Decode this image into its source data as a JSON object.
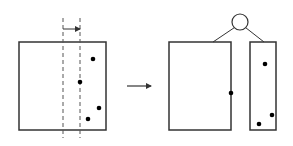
{
  "diagram": {
    "colors": {
      "stroke": "#333333",
      "dot": "#000000",
      "background": "#ffffff"
    },
    "before": {
      "box": {
        "x": 19,
        "y": 42,
        "w": 87,
        "h": 88
      },
      "dashed_lines": [
        {
          "x": 63,
          "y1": 18,
          "y2": 138
        },
        {
          "x": 80,
          "y1": 18,
          "y2": 138
        }
      ],
      "shift_arrow": {
        "x1": 63,
        "x2": 80,
        "y": 29
      },
      "points": [
        {
          "x": 93,
          "y": 59
        },
        {
          "x": 80,
          "y": 82
        },
        {
          "x": 99,
          "y": 108
        },
        {
          "x": 88,
          "y": 119
        }
      ]
    },
    "transition_arrow": {
      "x1": 127,
      "x2": 151,
      "y": 86
    },
    "after": {
      "parent_node": {
        "cx": 240,
        "cy": 22,
        "r": 8
      },
      "left_child": {
        "x": 169,
        "y": 42,
        "w": 62,
        "h": 88,
        "link_x": 213
      },
      "right_child": {
        "x": 250,
        "y": 42,
        "w": 26,
        "h": 88,
        "link_x": 264
      },
      "points": [
        {
          "x": 231,
          "y": 93
        },
        {
          "x": 265,
          "y": 64
        },
        {
          "x": 272,
          "y": 115
        },
        {
          "x": 259,
          "y": 124
        }
      ]
    }
  }
}
